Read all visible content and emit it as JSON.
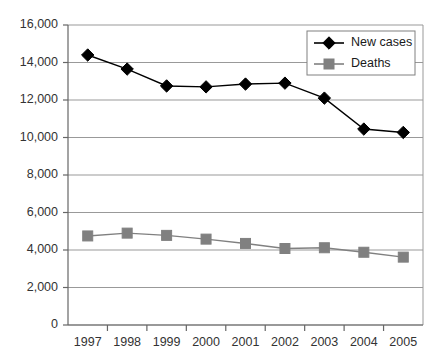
{
  "chart_data": {
    "type": "line",
    "title": "",
    "subtitle": "",
    "xlabel": "",
    "ylabel": "",
    "categories": [
      "1997",
      "1998",
      "1999",
      "2000",
      "2001",
      "2002",
      "2003",
      "2004",
      "2005"
    ],
    "series": [
      {
        "name": "New cases",
        "marker": "diamond",
        "color": "#000000",
        "values": [
          14400,
          13650,
          12750,
          12700,
          12850,
          12900,
          12100,
          10450,
          10270
        ]
      },
      {
        "name": "Deaths",
        "marker": "square",
        "color": "#808080",
        "values": [
          4750,
          4900,
          4780,
          4580,
          4350,
          4080,
          4120,
          3880,
          3620
        ]
      }
    ],
    "ylim": [
      0,
      16000
    ],
    "ytick_values": [
      0,
      2000,
      4000,
      6000,
      8000,
      10000,
      12000,
      14000,
      16000
    ],
    "ytick_labels": [
      "0",
      "2,000",
      "4,000",
      "6,000",
      "8,000",
      "10,000",
      "12,000",
      "14,000",
      "16,000"
    ],
    "grid": true,
    "grid_axis": "y",
    "legend_position": "top-right",
    "plot_border": true
  },
  "legend": {
    "entries": [
      {
        "label": "New cases"
      },
      {
        "label": "Deaths"
      }
    ]
  },
  "colors": {
    "series_new_cases": "#000000",
    "series_deaths": "#808080",
    "gridline": "#999999",
    "axis": "#666666",
    "text": "#333333",
    "legend_border": "#808080",
    "background": "#ffffff"
  }
}
